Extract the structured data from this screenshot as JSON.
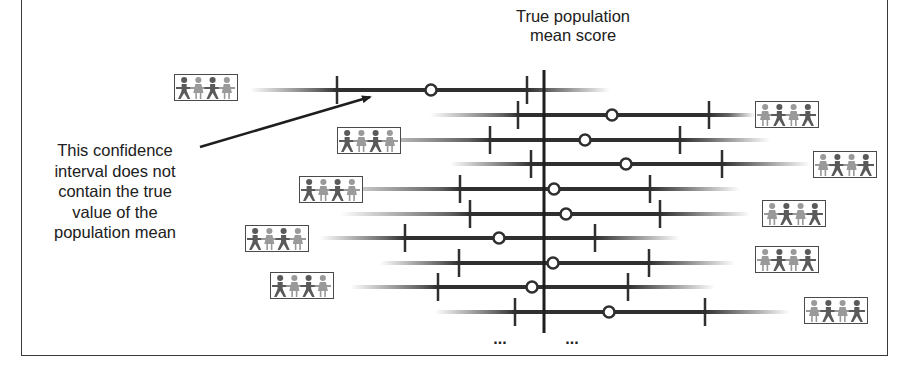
{
  "title": {
    "line1": "True population",
    "line2": "mean score"
  },
  "callout": {
    "line1": "This confidence",
    "line2": "interval does not",
    "line3": "contain the true",
    "line4": "value of the",
    "line5": "population mean"
  },
  "ellipsis_left": "...",
  "ellipsis_right": "...",
  "colors": {
    "line": "#2f2f2f",
    "fade": "#8a8a8a",
    "person_dark": "#5a5a5a",
    "person_light": "#9a9a9a",
    "frame": "#3a3a3a"
  },
  "true_mean_x": 544,
  "intervals": [
    {
      "y": 90,
      "fade_start": 250,
      "fade_end": 610,
      "lower": 337,
      "upper": 527,
      "mean": 431,
      "icon_side": "left",
      "icon_x": 174,
      "icon_y": 74,
      "contains_true_mean": false
    },
    {
      "y": 115,
      "fade_start": 430,
      "fade_end": 755,
      "lower": 518,
      "upper": 709,
      "mean": 612,
      "icon_side": "right",
      "icon_x": 755,
      "icon_y": 101,
      "contains_true_mean": true
    },
    {
      "y": 140,
      "fade_start": 340,
      "fade_end": 770,
      "lower": 490,
      "upper": 680,
      "mean": 585,
      "icon_side": "left",
      "icon_x": 337,
      "icon_y": 127,
      "contains_true_mean": true
    },
    {
      "y": 164,
      "fade_start": 450,
      "fade_end": 810,
      "lower": 531,
      "upper": 722,
      "mean": 626,
      "icon_side": "right",
      "icon_x": 813,
      "icon_y": 151,
      "contains_true_mean": true
    },
    {
      "y": 189,
      "fade_start": 320,
      "fade_end": 740,
      "lower": 460,
      "upper": 650,
      "mean": 554,
      "icon_side": "left",
      "icon_x": 299,
      "icon_y": 176,
      "contains_true_mean": true
    },
    {
      "y": 214,
      "fade_start": 340,
      "fade_end": 750,
      "lower": 470,
      "upper": 660,
      "mean": 566,
      "icon_side": "right",
      "icon_x": 762,
      "icon_y": 200,
      "contains_true_mean": true
    },
    {
      "y": 238,
      "fade_start": 320,
      "fade_end": 680,
      "lower": 405,
      "upper": 595,
      "mean": 499,
      "icon_side": "left",
      "icon_x": 245,
      "icon_y": 225,
      "contains_true_mean": true
    },
    {
      "y": 263,
      "fade_start": 380,
      "fade_end": 735,
      "lower": 459,
      "upper": 649,
      "mean": 553,
      "icon_side": "right",
      "icon_x": 755,
      "icon_y": 246,
      "contains_true_mean": true
    },
    {
      "y": 287,
      "fade_start": 350,
      "fade_end": 715,
      "lower": 438,
      "upper": 628,
      "mean": 532,
      "icon_side": "left",
      "icon_x": 270,
      "icon_y": 272,
      "contains_true_mean": true
    },
    {
      "y": 312,
      "fade_start": 435,
      "fade_end": 790,
      "lower": 515,
      "upper": 705,
      "mean": 609,
      "icon_side": "right",
      "icon_x": 804,
      "icon_y": 297,
      "contains_true_mean": true
    }
  ],
  "icons": {
    "sample_group": "people-group-icon"
  }
}
